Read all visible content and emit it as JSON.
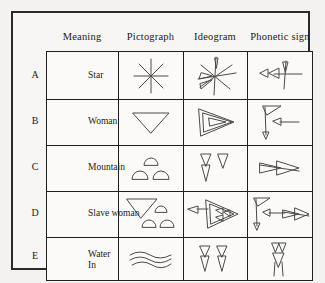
{
  "figure": {
    "background_color": "#f3f2f0",
    "frame_color": "#2a2a2a",
    "stroke_color": "#4a4a4a"
  },
  "table": {
    "headers": [
      {
        "key": "meaning",
        "label": "Meaning"
      },
      {
        "key": "pictograph",
        "label": "Pictograph"
      },
      {
        "key": "ideogram",
        "label": "Ideogram"
      },
      {
        "key": "phonetic",
        "label": "Phonetic sign"
      }
    ],
    "rows": [
      {
        "id": "A",
        "meaning": "Star",
        "pictograph": "eight-pointed-star",
        "ideogram": "star-with-wedges",
        "phonetic": "two-horizontal-wedges-and-vertical-wedge"
      },
      {
        "id": "B",
        "meaning": "Woman",
        "pictograph": "downward-triangle",
        "ideogram": "right-pointing-triangle",
        "phonetic": "vertical-stroke-with-wedges"
      },
      {
        "id": "C",
        "meaning": "Mountain",
        "pictograph": "three-mounds",
        "ideogram": "two-vertical-wedges",
        "phonetic": "crossed-horizontal-wedges"
      },
      {
        "id": "D",
        "meaning": "Slave woman",
        "pictograph": "triangle-with-three-mounds",
        "ideogram": "triangle-with-inner-wedges",
        "phonetic": "vertical-stroke-wedges-and-crossed-wedges"
      },
      {
        "id": "E",
        "meaning": "Water\nIn",
        "pictograph": "three-wavy-lines",
        "ideogram": "two-vertical-wedges",
        "phonetic": "stacked-wedges"
      }
    ]
  }
}
